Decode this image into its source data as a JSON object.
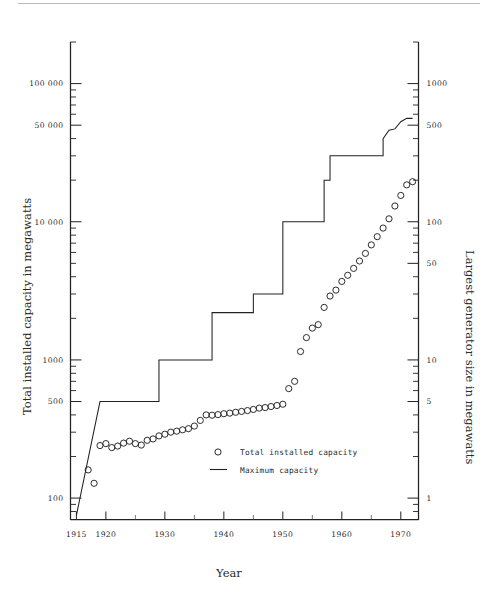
{
  "figure": {
    "background_color": "#ffffff",
    "ink_color": "#222222",
    "scan_artifact": true
  },
  "chart_data": {
    "type": "line",
    "title": "",
    "subtitle": "",
    "xlabel": "Year",
    "ylabel": "Total installed capacity in megawatts",
    "y2label": "Largest generator size in megawatts",
    "grid": false,
    "xlim": [
      1914,
      1973
    ],
    "xticks": [
      1915,
      1920,
      1930,
      1940,
      1950,
      1960,
      1970
    ],
    "xtick_labels": [
      "1915",
      "1920",
      "1930",
      "1940",
      "1950",
      "1960",
      "1970"
    ],
    "x_minor_ticks": [
      1925,
      1935,
      1945,
      1955,
      1965
    ],
    "yscale": "log",
    "ylim": [
      70,
      200000
    ],
    "yticks": [
      100,
      500,
      1000,
      10000,
      50000,
      100000
    ],
    "ytick_labels": [
      "100",
      "500",
      "1000",
      "10 000",
      "50 000",
      "100 000"
    ],
    "y2scale": "log",
    "y2lim": [
      0.7,
      2000
    ],
    "y2ticks": [
      1,
      5,
      10,
      50,
      100,
      500,
      1000
    ],
    "y2tick_labels": [
      "1",
      "5",
      "10",
      "50",
      "100",
      "500",
      "1000"
    ],
    "y_to_y2_ratio": 100,
    "legend_position": "center",
    "legend": [
      {
        "marker": "circle-open",
        "label": "Total installed capacity"
      },
      {
        "marker": "line",
        "label": "Maximum capacity"
      }
    ],
    "series": [
      {
        "name": "Total installed capacity",
        "axis": "left",
        "marker": "circle-open",
        "units": "megawatts",
        "points": [
          [
            1917,
            160
          ],
          [
            1918,
            128
          ],
          [
            1919,
            240
          ],
          [
            1920,
            248
          ],
          [
            1921,
            232
          ],
          [
            1922,
            238
          ],
          [
            1923,
            250
          ],
          [
            1924,
            258
          ],
          [
            1925,
            248
          ],
          [
            1926,
            242
          ],
          [
            1927,
            262
          ],
          [
            1928,
            268
          ],
          [
            1929,
            282
          ],
          [
            1930,
            290
          ],
          [
            1931,
            300
          ],
          [
            1932,
            305
          ],
          [
            1933,
            312
          ],
          [
            1934,
            318
          ],
          [
            1935,
            332
          ],
          [
            1936,
            365
          ],
          [
            1937,
            400
          ],
          [
            1938,
            398
          ],
          [
            1939,
            402
          ],
          [
            1940,
            408
          ],
          [
            1941,
            412
          ],
          [
            1942,
            418
          ],
          [
            1943,
            424
          ],
          [
            1944,
            430
          ],
          [
            1945,
            438
          ],
          [
            1946,
            448
          ],
          [
            1947,
            452
          ],
          [
            1948,
            460
          ],
          [
            1949,
            468
          ],
          [
            1950,
            478
          ],
          [
            1951,
            620
          ],
          [
            1952,
            700
          ],
          [
            1953,
            1150
          ],
          [
            1954,
            1450
          ],
          [
            1955,
            1700
          ],
          [
            1956,
            1800
          ],
          [
            1957,
            2400
          ],
          [
            1958,
            2900
          ],
          [
            1959,
            3200
          ],
          [
            1960,
            3700
          ],
          [
            1961,
            4100
          ],
          [
            1962,
            4600
          ],
          [
            1963,
            5200
          ],
          [
            1964,
            5900
          ],
          [
            1965,
            6800
          ],
          [
            1966,
            7800
          ],
          [
            1967,
            9000
          ],
          [
            1968,
            10500
          ],
          [
            1969,
            13000
          ],
          [
            1970,
            15500
          ],
          [
            1971,
            18500
          ],
          [
            1972,
            19500
          ]
        ]
      },
      {
        "name": "Maximum capacity",
        "axis": "left",
        "style": "step",
        "units": "megawatts",
        "points": [
          [
            1915,
            75
          ],
          [
            1919,
            500
          ],
          [
            1929,
            500
          ],
          [
            1929,
            1000
          ],
          [
            1938,
            1000
          ],
          [
            1938,
            2200
          ],
          [
            1945,
            2200
          ],
          [
            1945,
            3000
          ],
          [
            1950,
            3000
          ],
          [
            1950,
            10000
          ],
          [
            1957,
            10000
          ],
          [
            1957,
            20000
          ],
          [
            1958,
            20000
          ],
          [
            1958,
            30000
          ],
          [
            1967,
            30000
          ],
          [
            1967,
            40000
          ],
          [
            1968,
            46000
          ],
          [
            1969,
            47000
          ],
          [
            1970,
            53000
          ],
          [
            1971,
            56000
          ],
          [
            1972,
            56000
          ]
        ]
      }
    ]
  },
  "axes": {
    "left_title": "Total installed capacity in megawatts",
    "right_title": "Largest generator size in megawatts",
    "bottom_title": "Year"
  }
}
